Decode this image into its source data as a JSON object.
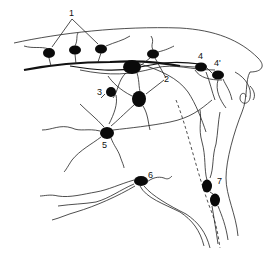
{
  "figure": {
    "type": "neuroanatomy line drawing",
    "background": "#ffffff",
    "ink_color": "#0a0a0a",
    "labels": [
      {
        "id": "1",
        "text": "1",
        "x": 72,
        "y": 17
      },
      {
        "id": "2",
        "text": "2",
        "x": 165,
        "y": 80
      },
      {
        "id": "3",
        "text": "3",
        "x": 98,
        "y": 99
      },
      {
        "id": "4",
        "text": "4",
        "x": 199,
        "y": 58
      },
      {
        "id": "4prime",
        "text": "4'",
        "x": 216,
        "y": 64
      },
      {
        "id": "5",
        "text": "5",
        "x": 102,
        "y": 147
      },
      {
        "id": "6",
        "text": "6",
        "x": 150,
        "y": 185
      },
      {
        "id": "7",
        "text": "7",
        "x": 218,
        "y": 184
      }
    ]
  }
}
